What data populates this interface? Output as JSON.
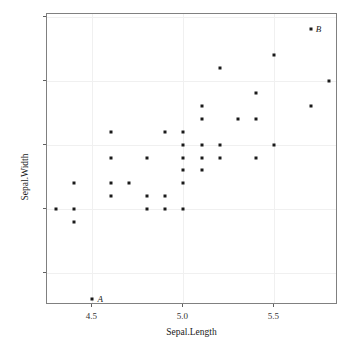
{
  "chart_data": {
    "type": "scatter",
    "title": "",
    "xlabel": "Sepal.Length",
    "ylabel": "Sepal.Width",
    "xlim": [
      4.25,
      5.85
    ],
    "ylim": [
      2.25,
      4.52
    ],
    "xticks": [
      4.5,
      5.0,
      5.5
    ],
    "xtick_labels": [
      "4.5",
      "5.0",
      "5.5"
    ],
    "yticks": [
      2.5,
      3.0,
      3.5,
      4.0,
      4.5
    ],
    "ytick_labels": [
      "2.5",
      "3.0",
      "3.5",
      "4.0",
      "4.5"
    ],
    "grid": true,
    "legend": "none",
    "marker": "filled-square",
    "marker_color": "#1a1a1a",
    "points": [
      {
        "x": 4.3,
        "y": 3.0
      },
      {
        "x": 4.4,
        "y": 3.2
      },
      {
        "x": 4.4,
        "y": 3.0
      },
      {
        "x": 4.4,
        "y": 2.9
      },
      {
        "x": 4.5,
        "y": 2.3,
        "label": "A"
      },
      {
        "x": 4.6,
        "y": 3.6
      },
      {
        "x": 4.6,
        "y": 3.4
      },
      {
        "x": 4.6,
        "y": 3.2
      },
      {
        "x": 4.6,
        "y": 3.1
      },
      {
        "x": 4.7,
        "y": 3.2
      },
      {
        "x": 4.8,
        "y": 3.4
      },
      {
        "x": 4.8,
        "y": 3.1
      },
      {
        "x": 4.8,
        "y": 3.0
      },
      {
        "x": 4.9,
        "y": 3.6
      },
      {
        "x": 4.9,
        "y": 3.1
      },
      {
        "x": 4.9,
        "y": 3.0
      },
      {
        "x": 5.0,
        "y": 3.6
      },
      {
        "x": 5.0,
        "y": 3.5
      },
      {
        "x": 5.0,
        "y": 3.4
      },
      {
        "x": 5.0,
        "y": 3.3
      },
      {
        "x": 5.0,
        "y": 3.2
      },
      {
        "x": 5.0,
        "y": 3.0
      },
      {
        "x": 5.1,
        "y": 3.8
      },
      {
        "x": 5.1,
        "y": 3.7
      },
      {
        "x": 5.1,
        "y": 3.5
      },
      {
        "x": 5.1,
        "y": 3.4
      },
      {
        "x": 5.1,
        "y": 3.3
      },
      {
        "x": 5.2,
        "y": 4.1
      },
      {
        "x": 5.2,
        "y": 3.5
      },
      {
        "x": 5.2,
        "y": 3.4
      },
      {
        "x": 5.3,
        "y": 3.7
      },
      {
        "x": 5.4,
        "y": 3.9
      },
      {
        "x": 5.4,
        "y": 3.7
      },
      {
        "x": 5.4,
        "y": 3.4
      },
      {
        "x": 5.5,
        "y": 4.2
      },
      {
        "x": 5.5,
        "y": 3.5
      },
      {
        "x": 5.7,
        "y": 4.4,
        "label": "B"
      },
      {
        "x": 5.7,
        "y": 3.8
      },
      {
        "x": 5.8,
        "y": 4.0
      }
    ],
    "annotations": [
      {
        "text": "A",
        "x": 4.5,
        "y": 2.3,
        "position": "right"
      },
      {
        "text": "B",
        "x": 5.7,
        "y": 4.4,
        "position": "right"
      }
    ]
  }
}
